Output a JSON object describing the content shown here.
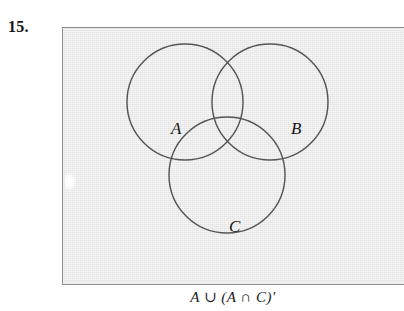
{
  "exercise": {
    "number_label": "15."
  },
  "figure": {
    "caption": "A ∪ (A ∩ C)′",
    "background_color": "#e4e4e4",
    "border_color": "#8c8c8c",
    "stroke_color": "#555555",
    "labels": {
      "a": "A",
      "b": "B",
      "c": "C"
    }
  },
  "chart_data": {
    "type": "diagram",
    "diagram_type": "venn",
    "title": "",
    "caption": "A ∪ (A ∩ C)′",
    "set_count": 3,
    "sets": [
      {
        "name": "A",
        "label": "A",
        "cx": 122,
        "cy": 74,
        "r": 58,
        "label_x": 108,
        "label_y": 92
      },
      {
        "name": "B",
        "label": "B",
        "cx": 207,
        "cy": 74,
        "r": 58,
        "label_x": 228,
        "label_y": 92
      },
      {
        "name": "C",
        "label": "C",
        "cx": 164,
        "cy": 147,
        "r": 58,
        "label_x": 166,
        "label_y": 190
      }
    ],
    "shaded_regions": [],
    "expression": "A ∪ (A ∩ C)′",
    "expression_parts": [
      "A",
      "∪",
      "(",
      "A",
      "∩",
      "C",
      ")",
      "′"
    ],
    "legend": [],
    "grid": false
  }
}
